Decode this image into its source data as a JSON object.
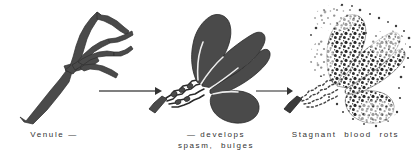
{
  "figure": {
    "background_color": "#ffffff",
    "ink_color": "#4a4a4a",
    "text_color": "#333333",
    "width": 415,
    "height": 162
  },
  "stages": [
    {
      "id": "stage-normal-venule",
      "index": 1,
      "caption": "Venule —",
      "art_name": "branching-venule-illustration",
      "description": "normal branching venule, solid dark gray"
    },
    {
      "id": "stage-spasm-bulges",
      "index": 2,
      "caption_line_1": "— develops",
      "caption_line_2": "spasm,  bulges",
      "art_name": "spasm-bulges-venule-illustration",
      "description": "venule with constricted twisted neck and swollen dark bulges"
    },
    {
      "id": "stage-stagnant-blood-rots",
      "index": 3,
      "caption": "Stagnant  blood  rots",
      "art_name": "stagnant-blood-rots-illustration",
      "description": "same bulged venule rendered in mottled stippled texture indicating decay"
    }
  ],
  "arrows": [
    {
      "id": "arrow-1",
      "name": "progression-arrow-1",
      "from_stage": 1,
      "to_stage": 2,
      "direction": "right"
    },
    {
      "id": "arrow-2",
      "name": "progression-arrow-2",
      "from_stage": 2,
      "to_stage": 3,
      "direction": "right"
    }
  ]
}
